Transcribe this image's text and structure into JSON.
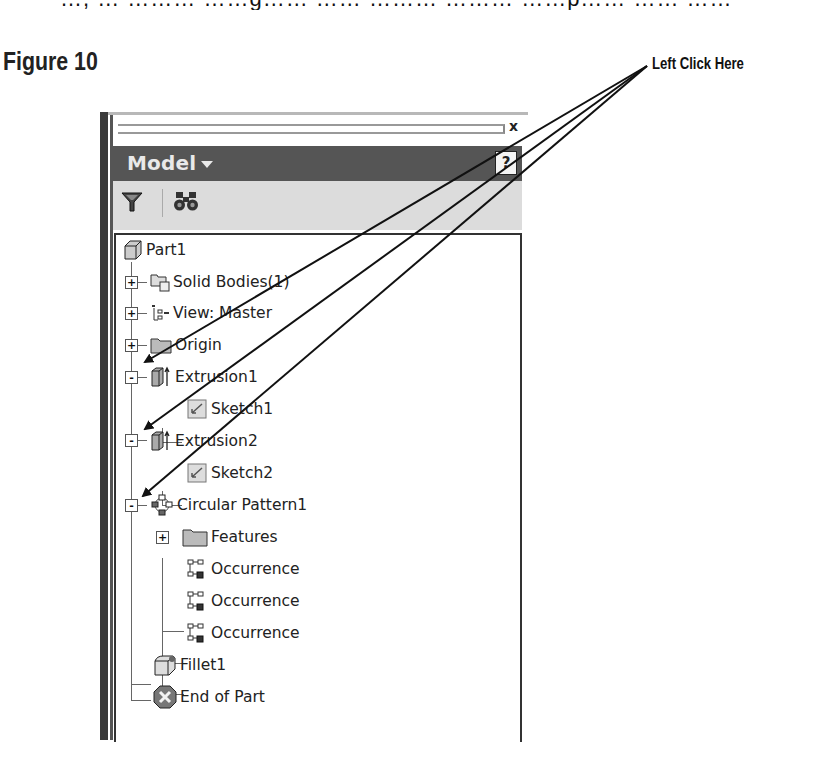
{
  "page": {
    "cut_text": "…, … ……… ……g…… …… ……… ……… ……p…… …… ……",
    "figure_title": "Figure 10",
    "callout": "Left Click Here"
  },
  "panel": {
    "close_glyph": "x",
    "header": {
      "title": "Model",
      "dropdown_icon": "caret-down-icon",
      "help_glyph": "?"
    },
    "toolbar": [
      {
        "name": "filter",
        "icon": "funnel-icon"
      },
      {
        "name": "find",
        "icon": "binoculars-icon"
      }
    ],
    "tree": [
      {
        "label": "Part1",
        "level": 0,
        "icon": "part-icon",
        "expander": null
      },
      {
        "label": "Solid Bodies(1)",
        "level": 1,
        "icon": "solid-bodies-icon",
        "expander": "+"
      },
      {
        "label": "View: Master",
        "level": 1,
        "icon": "view-icon",
        "expander": "+"
      },
      {
        "label": "Origin",
        "level": 1,
        "icon": "folder-icon",
        "expander": "+"
      },
      {
        "label": "Extrusion1",
        "level": 1,
        "icon": "extrusion-icon",
        "expander": "-"
      },
      {
        "label": "Sketch1",
        "level": 2,
        "icon": "sketch-icon",
        "expander": null
      },
      {
        "label": "Extrusion2",
        "level": 1,
        "icon": "extrusion-icon",
        "expander": "-"
      },
      {
        "label": "Sketch2",
        "level": 2,
        "icon": "sketch-icon",
        "expander": null
      },
      {
        "label": "Circular Pattern1",
        "level": 1,
        "icon": "circular-pattern-icon",
        "expander": "-"
      },
      {
        "label": "Features",
        "level": 2,
        "icon": "folder-icon",
        "expander": "+"
      },
      {
        "label": "Occurrence",
        "level": 2,
        "icon": "occurrence-icon",
        "expander": null
      },
      {
        "label": "Occurrence",
        "level": 2,
        "icon": "occurrence-icon",
        "expander": null
      },
      {
        "label": "Occurrence",
        "level": 2,
        "icon": "occurrence-icon",
        "expander": null
      },
      {
        "label": "Fillet1",
        "level": 1,
        "icon": "fillet-icon",
        "expander": null
      },
      {
        "label": "End of Part",
        "level": 1,
        "icon": "end-of-part-icon",
        "expander": null
      }
    ]
  },
  "colors": {
    "header_bg": "#555555",
    "toolbar_bg": "#dcdcdc",
    "text": "#222222"
  }
}
